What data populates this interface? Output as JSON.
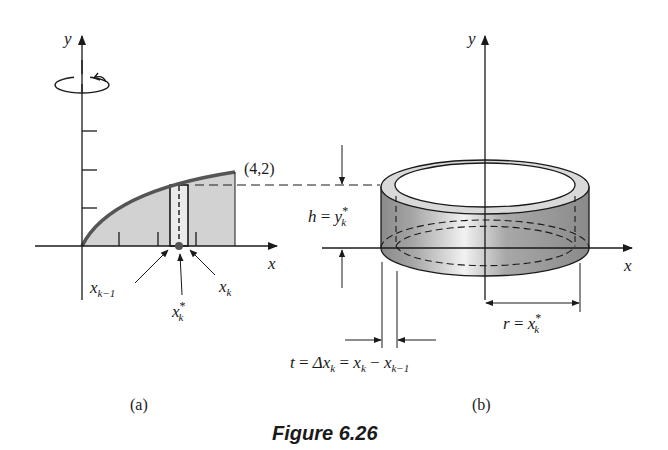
{
  "figure": {
    "caption": "Figure 6.26",
    "panel_a": {
      "label": "(a)",
      "y_axis_label": "y",
      "x_axis_label": "x",
      "point_label": "(4,2)",
      "x_k_minus_1": {
        "base": "x",
        "sub": "k−1"
      },
      "x_k_star": {
        "base": "x",
        "sub": "k",
        "sup": "*"
      },
      "x_k": {
        "base": "x",
        "sub": "k"
      },
      "rotation_icon": "rotation-arrow-about-y-axis",
      "region_fill": "#cfcfcf",
      "curve_color": "#555555"
    },
    "panel_b": {
      "label": "(b)",
      "y_axis_label": "y",
      "x_axis_label": "x",
      "height_label": {
        "lhs": "h",
        "eq": "=",
        "base": "y",
        "sub": "k",
        "sup": "*"
      },
      "radius_label": {
        "lhs": "r",
        "eq": "=",
        "base": "x",
        "sub": "k",
        "sup": "*"
      },
      "thickness_label": {
        "t": "t",
        "eq1": "=",
        "delta": "Δx",
        "delta_sub": "k",
        "eq2": "=",
        "xk": "x",
        "xk_sub": "k",
        "minus": "−",
        "xk1": "x",
        "xk1_sub": "k−1"
      },
      "shell_fill": "#9a9a9a"
    }
  }
}
